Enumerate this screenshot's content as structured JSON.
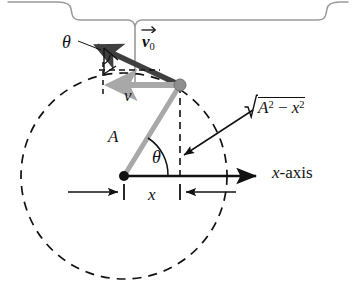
{
  "figure": {
    "kind": "physics-diagram",
    "background_color": "#ffffff"
  },
  "colors": {
    "ink": "#111111",
    "bracket_gray": "#9a9a9a",
    "light_gray": "#a8a8a8",
    "dark_arrow": "#3f3f3f",
    "particle_gray": "#8e8e8e"
  },
  "labels": {
    "theta_top": "θ",
    "theta_origin": "θ",
    "v0_symbol": "v",
    "v0_subscript": "0",
    "speed_v": "v",
    "amplitude_A": "A",
    "x_dimension": "x",
    "x_axis": "x",
    "x_axis_suffix": "-axis",
    "sqrt_radicand_A": "A",
    "sqrt_exp_A": "2",
    "sqrt_minus": "−",
    "sqrt_radicand_x": "x",
    "sqrt_exp_x": "2",
    "sqrt_full": "√(A² − x²)"
  },
  "geometry": {
    "origin": {
      "x": 124,
      "y": 176
    },
    "particle": {
      "x": 180,
      "y": 85
    },
    "circle_radius": 103,
    "x_axis_start": {
      "x": 124,
      "y": 176
    },
    "x_axis_end": {
      "x": 262,
      "y": 176
    },
    "radius_line_label": "A",
    "angle_at_origin_label": "θ",
    "v0_arrow_from": {
      "x": 180,
      "y": 85
    },
    "v0_arrow_to": {
      "x": 90,
      "y": 43
    },
    "v_arrow_from": {
      "x": 180,
      "y": 85
    },
    "v_arrow_to": {
      "x": 104,
      "y": 85
    },
    "dashed_vertical_from": {
      "x": 180,
      "y": 85
    },
    "dashed_vertical_to": {
      "x": 180,
      "y": 176
    },
    "dimension_line_y": 192,
    "bracket_tip": {
      "x": 135,
      "y": 8
    },
    "bracket_stem_bottom": {
      "x": 135,
      "y": 88
    }
  },
  "elements": {
    "bracket": "top-curly-bracket",
    "circle": "dashed-reference-circle",
    "v0_vector": "initial-velocity-vector",
    "v_vector": "velocity-projection-vector",
    "radius": "amplitude-radius-line",
    "projection": "dashed-projection-line",
    "x_dimension": "x-dimension-line",
    "sqrt_leader": "sqrt-leader-arrow",
    "theta_leader": "theta-leader-line"
  }
}
